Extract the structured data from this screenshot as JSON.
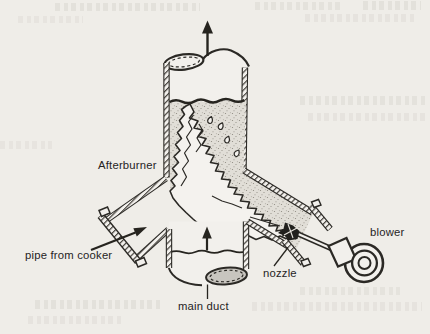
{
  "figure": {
    "type": "technical-illustration",
    "labels": {
      "afterburner": "Afterburner",
      "pipe_from_cooker": "pipe from cooker",
      "main_duct": "main duct",
      "nozzle": "nozzle",
      "blower": "blower"
    },
    "icons": {
      "exhaust_arrow": "up-arrow",
      "duct_flow_arrow": "up-arrow",
      "cooker_pipe_flow_arrow": "diagonal-arrow",
      "flame": "flame-shape"
    },
    "colors": {
      "paper": "#efede8",
      "ink": "#2b2925",
      "stipple_background": "#e1ded7",
      "duct_opening_shade": "#c8c5bf"
    }
  }
}
